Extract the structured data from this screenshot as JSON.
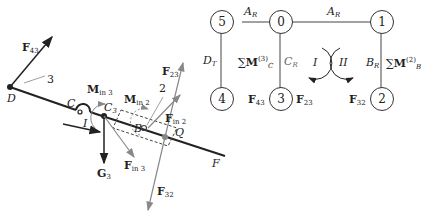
{
  "left_diagram": {
    "points": {
      "D": "D",
      "C": "C",
      "C3": "C",
      "C3_sub": "3",
      "B": "B",
      "Q": "Q",
      "F": "F",
      "I": "I"
    },
    "labels": {
      "link3": "3",
      "link2": "2"
    },
    "forces": {
      "F43": {
        "main": "F",
        "sub": "43"
      },
      "F23": {
        "main": "F",
        "sub": "23"
      },
      "F32": {
        "main": "F",
        "sub": "32"
      },
      "G3": {
        "main": "G",
        "sub": "3"
      },
      "Fin3": {
        "main": "F",
        "sub": "in 3"
      },
      "Fin2": {
        "main": "F",
        "sub": "in 2"
      },
      "Min3": {
        "main": "M",
        "sub": "in 3"
      },
      "Min2": {
        "main": "M",
        "sub": "in 2"
      }
    },
    "colors": {
      "body": "#222222",
      "force_gray": "#888888"
    }
  },
  "graph": {
    "nodes": [
      {
        "id": "5"
      },
      {
        "id": "0"
      },
      {
        "id": "1"
      },
      {
        "id": "4"
      },
      {
        "id": "3"
      },
      {
        "id": "2"
      }
    ],
    "edges": {
      "e50": {
        "main": "A",
        "sub": "R"
      },
      "e01": {
        "main": "A",
        "sub": "R"
      },
      "e54": {
        "main": "D",
        "sub": "T"
      },
      "e03": {
        "main": "C",
        "sub": "R"
      },
      "e12": {
        "main": "B",
        "sub": "R"
      }
    },
    "sums": {
      "left": {
        "sym": "∑",
        "main": "M",
        "sub": "C",
        "sup": "(3)"
      },
      "right": {
        "sym": "∑",
        "main": "M",
        "sub": "B",
        "sup": "(2)"
      }
    },
    "loops": {
      "I": "I",
      "II": "II"
    },
    "node_forces": {
      "n3_left": {
        "main": "F",
        "sub": "43"
      },
      "n3_right": {
        "main": "F",
        "sub": "23"
      },
      "n2_left": {
        "main": "F",
        "sub": "32"
      }
    }
  }
}
